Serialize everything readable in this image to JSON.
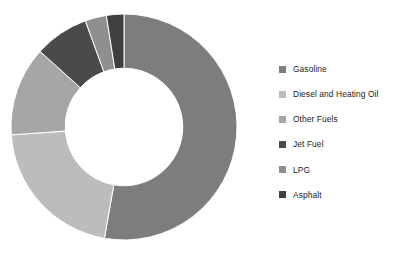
{
  "chart_data": {
    "type": "pie",
    "variant": "donut",
    "title": "",
    "subtitle": "",
    "xlabel": "",
    "ylabel": "",
    "grid": false,
    "legend_position": "right",
    "start_angle_deg": 0,
    "direction": "clockwise",
    "inner_radius_ratio": 0.52,
    "categories": [
      "Gasoline",
      "Diesel and Heating Oil",
      "Other Fuels",
      "Jet Fuel",
      "LPG",
      "Asphalt"
    ],
    "values": [
      46,
      21,
      13,
      8,
      4,
      3
    ],
    "units": "percent",
    "colors": [
      "#7d7d7d",
      "#bcbcbc",
      "#a6a6a6",
      "#4a4a4a",
      "#8f8f8f",
      "#3f3f3f"
    ],
    "slices": [
      {
        "label": "Gasoline",
        "value": 46,
        "color": "#7d7d7d",
        "start_deg": 0,
        "end_deg": 190
      },
      {
        "label": "Diesel and Heating Oil",
        "value": 21,
        "color": "#bcbcbc",
        "start_deg": 190,
        "end_deg": 266
      },
      {
        "label": "Other Fuels",
        "value": 13,
        "color": "#a6a6a6",
        "start_deg": 266,
        "end_deg": 312
      },
      {
        "label": "Jet Fuel",
        "value": 8,
        "color": "#4a4a4a",
        "start_deg": 312,
        "end_deg": 340
      },
      {
        "label": "LPG",
        "value": 4,
        "color": "#8f8f8f",
        "start_deg": 340,
        "end_deg": 351
      },
      {
        "label": "Asphalt",
        "value": 3,
        "color": "#3f3f3f",
        "start_deg": 351,
        "end_deg": 360
      }
    ]
  },
  "legend": {
    "items": [
      {
        "label": "Gasoline",
        "color": "#7d7d7d"
      },
      {
        "label": "Diesel and Heating Oil",
        "color": "#bcbcbc"
      },
      {
        "label": "Other Fuels",
        "color": "#a6a6a6"
      },
      {
        "label": "Jet Fuel",
        "color": "#4a4a4a"
      },
      {
        "label": "LPG",
        "color": "#8f8f8f"
      },
      {
        "label": "Asphalt",
        "color": "#3f3f3f"
      }
    ]
  }
}
